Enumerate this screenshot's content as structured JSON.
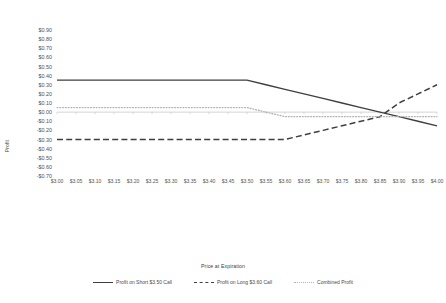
{
  "chart_data": {
    "type": "line",
    "title": "",
    "xlabel": "Price at Expiration",
    "ylabel": "Profit",
    "grid": false,
    "legend_position": "bottom-center",
    "xlim": [
      3.0,
      4.0
    ],
    "ylim": [
      -0.7,
      0.9
    ],
    "ytick_step": 0.1,
    "xtick_step": 0.05,
    "x": [
      3.0,
      3.05,
      3.1,
      3.15,
      3.2,
      3.25,
      3.3,
      3.35,
      3.4,
      3.45,
      3.5,
      3.55,
      3.6,
      3.65,
      3.7,
      3.75,
      3.8,
      3.85,
      3.9,
      3.95,
      4.0
    ],
    "categories": [
      "$3.00",
      "$3.05",
      "$3.10",
      "$3.15",
      "$3.20",
      "$3.25",
      "$3.30",
      "$3.35",
      "$3.40",
      "$3.45",
      "$3.50",
      "$3.55",
      "$3.60",
      "$3.65",
      "$3.70",
      "$3.75",
      "$3.80",
      "$3.85",
      "$3.90",
      "$3.95",
      "$4.00"
    ],
    "ytick_labels": [
      "$0.90",
      "$0.80",
      "$0.70",
      "$0.60",
      "$0.50",
      "$0.40",
      "$0.30",
      "$0.20",
      "$0.10",
      "$0.00",
      "-$0.10",
      "-$0.20",
      "-$0.30",
      "-$0.40",
      "-$0.50",
      "-$0.60",
      "-$0.70"
    ],
    "ytick_values": [
      0.9,
      0.8,
      0.7,
      0.6,
      0.5,
      0.4,
      0.3,
      0.2,
      0.1,
      0.0,
      -0.1,
      -0.2,
      -0.3,
      -0.4,
      -0.5,
      -0.6,
      -0.7
    ],
    "series": [
      {
        "name": "Profit on Short $3.50 Call",
        "style": "solid",
        "color": "#3f3f3f",
        "values": [
          0.35,
          0.35,
          0.35,
          0.35,
          0.35,
          0.35,
          0.35,
          0.35,
          0.35,
          0.35,
          0.35,
          0.3,
          0.25,
          0.2,
          0.15,
          0.1,
          0.05,
          0.0,
          -0.05,
          -0.1,
          -0.15
        ]
      },
      {
        "name": "Profit on Long $3.60 Call",
        "style": "dashed",
        "color": "#3f3f3f",
        "values": [
          -0.3,
          -0.3,
          -0.3,
          -0.3,
          -0.3,
          -0.3,
          -0.3,
          -0.3,
          -0.3,
          -0.3,
          -0.3,
          -0.3,
          -0.3,
          -0.25,
          -0.2,
          -0.15,
          -0.1,
          -0.05,
          0.1,
          0.2,
          0.3
        ]
      },
      {
        "name": "Combined Profit",
        "style": "dotted",
        "color": "#b4b4b4",
        "values": [
          0.05,
          0.05,
          0.05,
          0.05,
          0.05,
          0.05,
          0.05,
          0.05,
          0.05,
          0.05,
          0.05,
          0.0,
          -0.05,
          -0.05,
          -0.05,
          -0.05,
          -0.05,
          -0.05,
          -0.05,
          -0.05,
          -0.05
        ]
      }
    ]
  },
  "legend": {
    "items": [
      {
        "label": "Profit on Short $3.50 Call",
        "style": "solid"
      },
      {
        "label": "Profit on Long $3.60 Call",
        "style": "dashed"
      },
      {
        "label": "Combined Profit",
        "style": "dotted"
      }
    ]
  }
}
